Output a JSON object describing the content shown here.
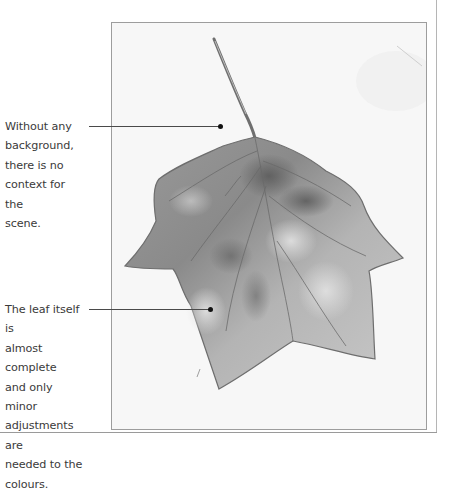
{
  "figure": {
    "style": "grayscale watercolour on white paper"
  },
  "annotations": [
    {
      "text": "Without any background, there is no context for the scene.",
      "lines": [
        "Without any",
        "background,",
        "there is no",
        "context for the",
        "scene."
      ]
    },
    {
      "text": "The leaf itself is almost complete and only minor adjustments are needed to the colours.",
      "lines": [
        "The leaf itself is",
        "almost complete",
        "and only minor",
        "adjustments are",
        "needed to the",
        "colours."
      ]
    }
  ],
  "colors": {
    "text": "#3a3a3a",
    "callout": "#4a4a4a",
    "frame_border": "#9d9d9d",
    "paper": "#f6f6f6"
  }
}
